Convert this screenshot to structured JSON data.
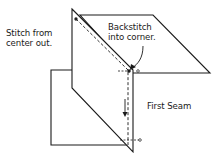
{
  "diagram": {
    "labels": {
      "stitch_from_center": [
        "Stitch from",
        "center out."
      ],
      "backstitch": [
        "Backstitch",
        "into corner."
      ],
      "first_seam": "First Seam"
    },
    "colors": {
      "line": "#1a1a1a",
      "background": "#ffffff"
    }
  }
}
